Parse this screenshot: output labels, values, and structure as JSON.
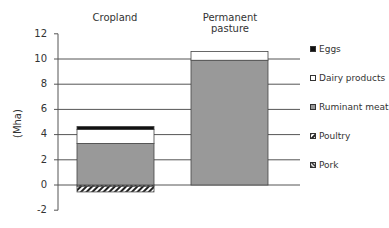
{
  "chart_data": {
    "type": "bar",
    "stacked": true,
    "title": "",
    "xlabel": "",
    "ylabel": "(Mha)",
    "ylim": [
      -2,
      12
    ],
    "yticks": [
      -2,
      0,
      2,
      4,
      6,
      8,
      10,
      12
    ],
    "grid": true,
    "legend_position": "right",
    "categories": [
      "Cropland",
      "Permanent pasture"
    ],
    "series": [
      {
        "name": "Pork",
        "pattern": "hatch-dense",
        "values": [
          -0.1,
          0
        ]
      },
      {
        "name": "Poultry",
        "pattern": "hatch",
        "values": [
          -0.45,
          0
        ]
      },
      {
        "name": "Ruminant meat",
        "color": "#999999",
        "values": [
          3.3,
          9.9
        ]
      },
      {
        "name": "Dairy products",
        "color": "#ffffff",
        "values": [
          1.1,
          0.7
        ]
      },
      {
        "name": "Eggs",
        "color": "#111111",
        "values": [
          0.25,
          0
        ]
      }
    ]
  },
  "labels": {
    "ylabel": "(Mha)",
    "categories": [
      "Cropland",
      "Permanent pasture"
    ],
    "ticks": [
      "12",
      "10",
      "8",
      "6",
      "4",
      "2",
      "0",
      "-2"
    ],
    "legend": [
      "Eggs",
      "Dairy products",
      "Ruminant meat",
      "Poultry",
      "Pork"
    ]
  }
}
